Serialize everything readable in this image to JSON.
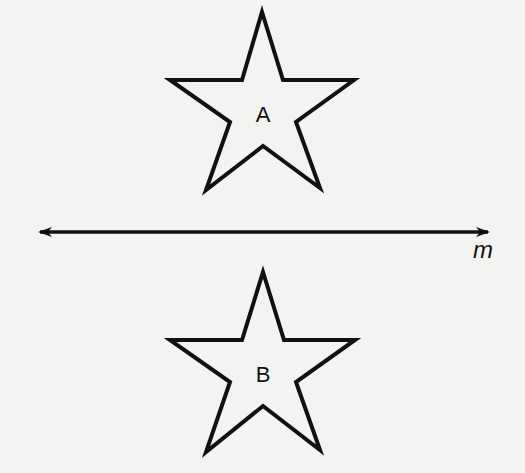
{
  "figure": {
    "stars": [
      {
        "label": "A",
        "position": "above line"
      },
      {
        "label": "B",
        "position": "below line"
      }
    ],
    "line": {
      "label": "m",
      "type": "double-arrow line"
    }
  },
  "colors": {
    "stroke": "#111111",
    "background": "#f3f3f1"
  }
}
